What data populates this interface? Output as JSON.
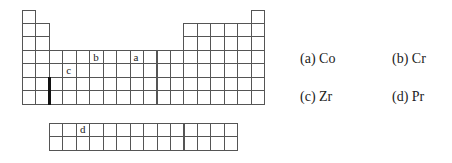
{
  "diagram": {
    "type": "periodic-table-outline",
    "main_table": {
      "rows": 7,
      "columns": 18,
      "origin": [
        22,
        9.5
      ],
      "cell_size": 13.45,
      "layout": [
        [
          1,
          18
        ],
        [
          1,
          2,
          13,
          14,
          15,
          16,
          17,
          18
        ],
        [
          1,
          2,
          13,
          14,
          15,
          16,
          17,
          18
        ],
        [
          1,
          2,
          3,
          4,
          5,
          6,
          7,
          8,
          9,
          10,
          11,
          12,
          13,
          14,
          15,
          16,
          17,
          18
        ],
        [
          1,
          2,
          3,
          4,
          5,
          6,
          7,
          8,
          9,
          10,
          11,
          12,
          13,
          14,
          15,
          16,
          17,
          18
        ],
        [
          1,
          2,
          3,
          4,
          5,
          6,
          7,
          8,
          9,
          10,
          11,
          12,
          13,
          14,
          15,
          16,
          17,
          18
        ],
        [
          1,
          2,
          3,
          4,
          5,
          6,
          7,
          8,
          9,
          10,
          11,
          12,
          13,
          14,
          15,
          16,
          17,
          18
        ]
      ],
      "markers": [
        {
          "label": "b",
          "row": 4,
          "col": 6
        },
        {
          "label": "a",
          "row": 4,
          "col": 9
        },
        {
          "label": "c",
          "row": 5,
          "col": 4
        }
      ],
      "thick_divider": {
        "after_col": 2,
        "rows": [
          6,
          7
        ]
      }
    },
    "f_block": {
      "rows": 2,
      "columns": 14,
      "origin": [
        49,
        123
      ],
      "cell_size": 13.45,
      "markers": [
        {
          "label": "d",
          "row": 1,
          "col": 3
        }
      ]
    }
  },
  "options": [
    {
      "label": "(a)  Co",
      "x": 300,
      "y": 51
    },
    {
      "label": "(b)  Cr",
      "x": 392,
      "y": 51
    },
    {
      "label": "(c)  Zr",
      "x": 300,
      "y": 89
    },
    {
      "label": "(d)  Pr",
      "x": 392,
      "y": 89
    }
  ]
}
